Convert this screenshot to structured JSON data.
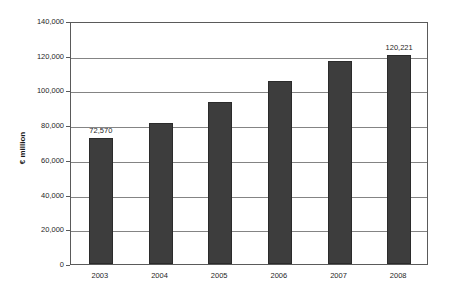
{
  "chart_data": {
    "type": "bar",
    "title": "",
    "subtitle": "",
    "xlabel": "",
    "ylabel": "€ million",
    "categories": [
      "2003",
      "2004",
      "2005",
      "2006",
      "2007",
      "2008"
    ],
    "values": [
      72570,
      81000,
      93500,
      105500,
      117000,
      120221
    ],
    "series": [
      {
        "name": "€ million",
        "values": [
          72570,
          81000,
          93500,
          105500,
          117000,
          120221
        ]
      }
    ],
    "data_labels": [
      "72,570",
      "",
      "",
      "",
      "",
      "120,221"
    ],
    "ylim": [
      0,
      140000
    ],
    "ytick_values": [
      0,
      20000,
      40000,
      60000,
      80000,
      100000,
      120000,
      140000
    ],
    "ytick_labels": [
      "0",
      "20,000",
      "40,000",
      "60,000",
      "80,000",
      "100,000",
      "120,000",
      "140,000"
    ],
    "grid": true,
    "grid_axis": "y",
    "legend": false,
    "legend_position": "none",
    "bar_color": "#3d3d3d",
    "bar_border_color": "#2b2b2b",
    "gridline_color": "#848484",
    "frame_color": "#5a5a5a",
    "background_color": "#ffffff",
    "text_color": "#1f1f1f"
  }
}
